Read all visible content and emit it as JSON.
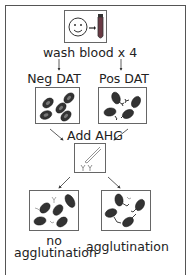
{
  "diagram": {
    "steps": {
      "collect": {
        "icon": "face-to-blood-tube-icon"
      },
      "wash": {
        "label": "wash blood  x 4"
      },
      "neg_dat": {
        "label": "Neg DAT",
        "icon": "unbound-red-cells-icon"
      },
      "pos_dat": {
        "label": "Pos DAT",
        "icon": "antibody-coated-red-cells-icon"
      },
      "add_ahg": {
        "label": "Add AHG",
        "icon": "pipette-antibody-icon"
      },
      "no_agglutination": {
        "label_line1": "no",
        "label_line2": "agglutination",
        "icon": "dispersed-cells-icon"
      },
      "agglutination": {
        "label": "agglutination",
        "icon": "clumped-cells-icon"
      }
    },
    "colors": {
      "cell_fill": "#333333",
      "cell_highlight": "#777777",
      "frame": "#555555",
      "antibody": "#999999"
    }
  }
}
